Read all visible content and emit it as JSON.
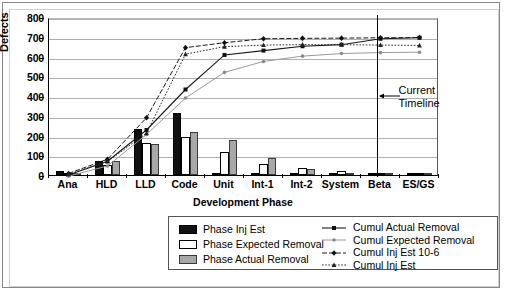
{
  "chart_data": {
    "type": "bar",
    "title": "",
    "xlabel": "Development Phase",
    "ylabel": "Defects",
    "ylim": [
      0,
      800
    ],
    "ytick_step": 100,
    "yticks": [
      "0",
      "100",
      "200",
      "300",
      "400",
      "500",
      "600",
      "700",
      "800"
    ],
    "grid": true,
    "legend_position": "bottom",
    "categories": [
      "Ana",
      "HLD",
      "LLD",
      "Code",
      "Unit",
      "Int-1",
      "Int-2",
      "System",
      "Beta",
      "ES/GS"
    ],
    "bar_series": [
      {
        "name": "Phase Inj Est",
        "color": "#111111",
        "values": [
          18,
          72,
          232,
          315,
          5,
          8,
          6,
          5,
          4,
          3
        ]
      },
      {
        "name": "Phase Expected Removal",
        "color": "#ffffff",
        "values": [
          4,
          52,
          160,
          192,
          118,
          55,
          38,
          22,
          10,
          4
        ]
      },
      {
        "name": "Phase Actual Removal",
        "color": "#a8a8a8",
        "values": [
          10,
          70,
          158,
          218,
          175,
          85,
          28,
          8,
          4,
          4
        ]
      }
    ],
    "line_series": [
      {
        "name": "Cumul Actual Removal",
        "style": "solid-dark",
        "marker": "square",
        "values": [
          10,
          80,
          238,
          443,
          618,
          640,
          662,
          670,
          700,
          705
        ]
      },
      {
        "name": "Cumul Expected Removal",
        "style": "solid-light",
        "marker": "dot",
        "values": [
          4,
          56,
          215,
          400,
          530,
          585,
          612,
          625,
          630,
          632
        ]
      },
      {
        "name": "Cumul Inj Est 10-6",
        "style": "dashed",
        "marker": "diamond",
        "values": [
          18,
          90,
          300,
          655,
          680,
          700,
          702,
          703,
          705,
          706
        ]
      },
      {
        "name": "Cumul Inj Est",
        "style": "dotted",
        "marker": "triangle",
        "values": [
          14,
          78,
          222,
          622,
          660,
          668,
          670,
          670,
          668,
          666
        ]
      }
    ],
    "annotations": [
      {
        "name": "current-timeline",
        "label_line1": "Current",
        "label_line2": "Timeline",
        "at_category": "Beta"
      }
    ]
  },
  "legend": {
    "bar_entries": [
      {
        "label": "Phase Inj Est",
        "swatch": "inj"
      },
      {
        "label": "Phase Expected Removal",
        "swatch": "exp"
      },
      {
        "label": "Phase Actual Removal",
        "swatch": "act"
      }
    ],
    "line_entries": [
      {
        "label": "Cumul Actual Removal",
        "icon": "solid-line-square-marker"
      },
      {
        "label": "Cumul Expected Removal",
        "icon": "solid-light-line-dot-marker"
      },
      {
        "label": "Cumul Inj Est 10-6",
        "icon": "dashed-line-diamond-marker"
      },
      {
        "label": "Cumul Inj Est",
        "icon": "dotted-line-triangle-marker"
      }
    ]
  },
  "colors": {
    "bar_inj": "#111111",
    "bar_expected": "#ffffff",
    "bar_actual": "#a8a8a8",
    "gridline": "#b0b0b0",
    "axis": "#000000",
    "line_light": "#9a9a9a"
  }
}
